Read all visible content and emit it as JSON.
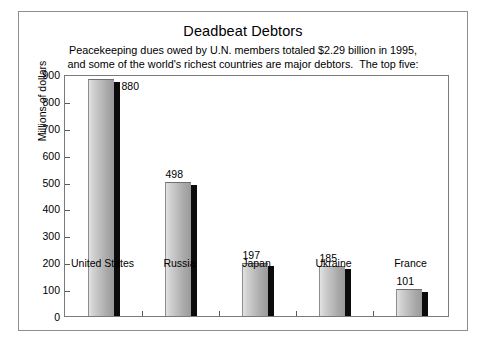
{
  "chart_data": {
    "type": "bar",
    "title": "Deadbeat Debtors",
    "subtitle_line1": "Peacekeeping dues owed by U.N. members totaled $2.29 billion in 1995,",
    "subtitle_line2": "and some of the world's richest countries are major debtors.  The top five:",
    "categories": [
      "United States",
      "Russia",
      "Japan",
      "Ukraine",
      "France"
    ],
    "values": [
      880,
      498,
      197,
      185,
      101
    ],
    "value_labels": [
      "880",
      "498",
      "197",
      "185",
      "101"
    ],
    "xlabel": "",
    "ylabel": "Millions of dollars",
    "ylim": [
      0,
      900
    ],
    "ytick_labels": [
      "900",
      "800",
      "700",
      "600",
      "500",
      "400",
      "300",
      "200",
      "100",
      "0"
    ],
    "ytick_values": [
      900,
      800,
      700,
      600,
      500,
      400,
      300,
      200,
      100,
      0
    ],
    "grid": false,
    "legend": "none",
    "bar_fill_light": "#e2e2e2",
    "bar_fill_dark": "#9a9a9a",
    "bar_shadow_color": "#0b0b0b",
    "frame_color": "#7a7a7a",
    "label_placement": [
      "right",
      "above",
      "above",
      "above",
      "above"
    ]
  }
}
